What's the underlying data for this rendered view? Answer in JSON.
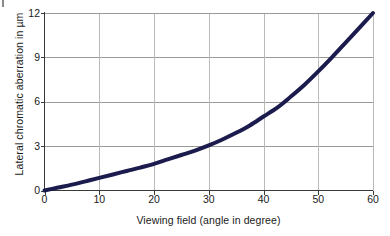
{
  "chart_data": {
    "type": "line",
    "title": "",
    "xlabel": "Viewing field (angle in degree)",
    "ylabel": "Lateral chromatic aberration in µm",
    "xlim": [
      0,
      60
    ],
    "ylim": [
      0,
      12
    ],
    "xticks": [
      0,
      10,
      20,
      30,
      40,
      50,
      60
    ],
    "xtick_labels": [
      "0",
      "10",
      "20",
      "30",
      "40",
      "50",
      "60"
    ],
    "yticks": [
      0,
      3,
      6,
      9,
      12
    ],
    "ytick_labels": [
      "0",
      "3",
      "6",
      "9",
      "12"
    ],
    "grid": "horizontal-and-vertical",
    "legend": "none",
    "series": [
      {
        "name": "Lateral chromatic aberration",
        "color": "#1b1b4e",
        "line_width_px": 4,
        "x": [
          0,
          2.5,
          5,
          7.5,
          10,
          12.5,
          15,
          17.5,
          20,
          22.5,
          25,
          27.5,
          30,
          32.5,
          35,
          37.5,
          40,
          42.5,
          45,
          47.5,
          50,
          52.5,
          55,
          57.5,
          60
        ],
        "values": [
          0.0,
          0.2,
          0.4,
          0.62,
          0.85,
          1.08,
          1.32,
          1.55,
          1.8,
          2.1,
          2.4,
          2.7,
          3.05,
          3.45,
          3.9,
          4.4,
          5.0,
          5.6,
          6.35,
          7.15,
          8.05,
          9.0,
          10.0,
          11.0,
          12.0
        ]
      }
    ],
    "colors": {
      "curve": "#1b1b4e",
      "gridline": "#9a9a96",
      "axis": "#3a3a38",
      "plot_background": "#ffffff",
      "text": "#1a1a1a"
    }
  }
}
